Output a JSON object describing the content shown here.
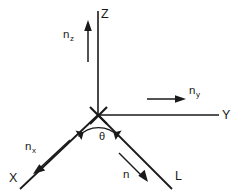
{
  "figure": {
    "type": "vector-coordinate-diagram",
    "background_color": "#ffffff",
    "line_color": "#1a1a1a",
    "width": 246,
    "height": 195
  },
  "axes": [
    {
      "id": "z-axis",
      "label": "Z",
      "direction": "up",
      "label_x": 101,
      "label_y": 8
    },
    {
      "id": "y-axis",
      "label": "Y",
      "direction": "right",
      "label_x": 222,
      "label_y": 109
    },
    {
      "id": "x-axis",
      "label": "X",
      "direction": "down-left",
      "label_x": 9,
      "label_y": 172
    },
    {
      "id": "l-ray",
      "label": "L",
      "direction": "down-right",
      "label_x": 175,
      "label_y": 170
    }
  ],
  "vectors": [
    {
      "id": "n-z",
      "base": "n",
      "subscript": "z",
      "label_x": 63,
      "label_y": 29,
      "direction": "up"
    },
    {
      "id": "n-y",
      "base": "n",
      "subscript": "y",
      "label_x": 189,
      "label_y": 85,
      "direction": "right"
    },
    {
      "id": "n-x",
      "base": "n",
      "subscript": "x",
      "label_x": 25,
      "label_y": 141,
      "direction": "down-left"
    },
    {
      "id": "n",
      "base": "n",
      "subscript": "",
      "label_x": 123,
      "label_y": 169,
      "direction": "down-right"
    }
  ],
  "angle": {
    "id": "theta",
    "symbol": "θ",
    "label_x": 99,
    "label_y": 131,
    "between": [
      "x-axis",
      "l-ray"
    ]
  }
}
